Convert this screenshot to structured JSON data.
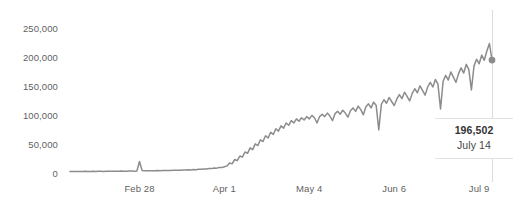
{
  "chart_data": {
    "type": "line",
    "title": "",
    "subtitle": "",
    "xlabel": "",
    "ylabel": "",
    "grid": false,
    "legend": "none",
    "ylim": [
      0,
      250000
    ],
    "y_ticks": [
      0,
      50000,
      100000,
      150000,
      200000,
      250000
    ],
    "y_tick_labels": [
      "0",
      "50,000",
      "100,000",
      "150,000",
      "200,000",
      "250,000"
    ],
    "x_tick_labels": [
      "Feb 28",
      "Apr 1",
      "May 4",
      "Jun 6",
      "Jul 9"
    ],
    "x_tick_indices": [
      27,
      60,
      93,
      126,
      159
    ],
    "x_range_index": [
      0,
      164
    ],
    "line_color": "#8c8c8c",
    "marker_color": "#8c8c8c",
    "rule_color": "#dcdcdc",
    "series": [
      {
        "name": "Daily value",
        "values": [
          4200,
          4300,
          4100,
          4500,
          4400,
          4300,
          4600,
          4500,
          4400,
          4600,
          4500,
          4700,
          4600,
          4500,
          4800,
          4700,
          4600,
          4900,
          4800,
          4700,
          5000,
          4900,
          4800,
          5100,
          5000,
          4900,
          5200,
          21500,
          6200,
          5400,
          5600,
          5500,
          5700,
          5600,
          5900,
          5800,
          6000,
          5900,
          6200,
          6100,
          6400,
          6300,
          6600,
          6500,
          6900,
          6800,
          7200,
          7100,
          7600,
          7500,
          8100,
          8000,
          8700,
          8600,
          9400,
          9300,
          10200,
          10100,
          11200,
          11000,
          12500,
          14000,
          19000,
          17500,
          25000,
          23000,
          31000,
          29000,
          38000,
          35500,
          45000,
          42000,
          52000,
          49000,
          59000,
          56000,
          66000,
          62000,
          72000,
          68000,
          78000,
          74000,
          83000,
          79000,
          88000,
          84000,
          92000,
          88000,
          95000,
          91000,
          97000,
          93000,
          99000,
          95000,
          101000,
          97000,
          88000,
          99000,
          103000,
          99000,
          105000,
          100000,
          92000,
          104000,
          108000,
          103000,
          110000,
          105000,
          98000,
          109000,
          114000,
          108000,
          117000,
          111000,
          102000,
          116000,
          121000,
          114000,
          124000,
          118000,
          76000,
          120000,
          128000,
          122000,
          132000,
          125000,
          118000,
          129000,
          137000,
          130000,
          141000,
          134000,
          126000,
          139000,
          147000,
          140000,
          152000,
          144000,
          136000,
          150000,
          158000,
          150000,
          163000,
          155000,
          112000,
          160000,
          170000,
          162000,
          176000,
          167000,
          158000,
          173000,
          183000,
          174000,
          189000,
          180000,
          145000,
          186000,
          198000,
          190000,
          205000,
          196000,
          212000,
          225000,
          196502
        ]
      }
    ],
    "annotation": {
      "value_label": "196,502",
      "date_label": "July 14",
      "point_index": 164,
      "point_value": 196502
    }
  }
}
